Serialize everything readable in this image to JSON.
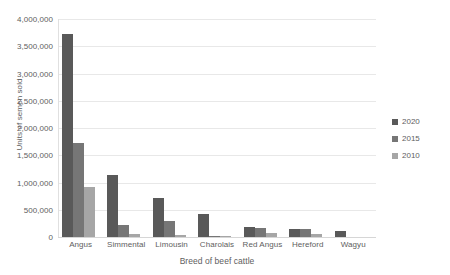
{
  "chart_data": {
    "type": "bar",
    "title": "",
    "xlabel": "Breed of beef cattle",
    "ylabel": "Units of semen sold",
    "ylim": [
      0,
      4000000
    ],
    "yticks": [
      "0",
      "500,000",
      "1,000,000",
      "1,500,000",
      "2,000,000",
      "2,500,000",
      "3,000,000",
      "3,500,000",
      "4,000,000"
    ],
    "ytick_values": [
      0,
      500000,
      1000000,
      1500000,
      2000000,
      2500000,
      3000000,
      3500000,
      4000000
    ],
    "grid": true,
    "legend_position": "right",
    "categories": [
      "Angus",
      "Simmental",
      "Limousin",
      "Charolais",
      "Red Angus",
      "Hereford",
      "Wagyu"
    ],
    "series": [
      {
        "name": "2020",
        "color": "#595959",
        "values": [
          3720000,
          1140000,
          710000,
          420000,
          175000,
          155000,
          110000
        ]
      },
      {
        "name": "2015",
        "color": "#767676",
        "values": [
          1730000,
          215000,
          300000,
          15000,
          165000,
          140000,
          0
        ]
      },
      {
        "name": "2010",
        "color": "#a6a6a6",
        "values": [
          910000,
          60000,
          40000,
          10000,
          70000,
          50000,
          0
        ]
      }
    ]
  },
  "colors": {
    "gridline": "#e8e8e8",
    "axis": "#d6d6d6",
    "text": "#5e5e5e",
    "background": "#ffffff"
  }
}
